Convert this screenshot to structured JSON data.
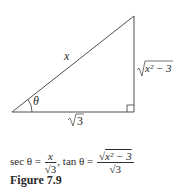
{
  "diagram": {
    "type": "right-triangle",
    "labels": {
      "hypotenuse": "x",
      "opposite_base": "x² − 3",
      "adjacent_base": "3",
      "angle": "θ"
    }
  },
  "formula": {
    "sec_lhs": "sec θ =",
    "sec_num": "x",
    "sec_den": "3",
    "sep": ",",
    "tan_lhs": "tan θ =",
    "tan_num": "x² − 3",
    "tan_den": "3"
  },
  "caption": "Figure 7.9"
}
